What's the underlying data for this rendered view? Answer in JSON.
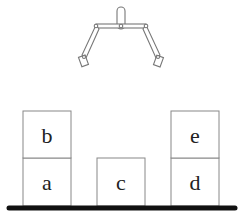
{
  "diagram": {
    "type": "blocks-world",
    "gripper": {
      "state": "open",
      "position": "above-center"
    },
    "blocks": [
      {
        "id": "a",
        "label": "a",
        "x": 23,
        "y": 158,
        "w": 48,
        "h": 48,
        "on": "table"
      },
      {
        "id": "b",
        "label": "b",
        "x": 23,
        "y": 111,
        "w": 48,
        "h": 47,
        "on": "a"
      },
      {
        "id": "c",
        "label": "c",
        "x": 97,
        "y": 158,
        "w": 48,
        "h": 48,
        "on": "table"
      },
      {
        "id": "d",
        "label": "d",
        "x": 171,
        "y": 158,
        "w": 48,
        "h": 48,
        "on": "table"
      },
      {
        "id": "e",
        "label": "e",
        "x": 171,
        "y": 111,
        "w": 48,
        "h": 47,
        "on": "d"
      }
    ],
    "table": {
      "color": "#111111"
    },
    "line_color": "#888888"
  }
}
